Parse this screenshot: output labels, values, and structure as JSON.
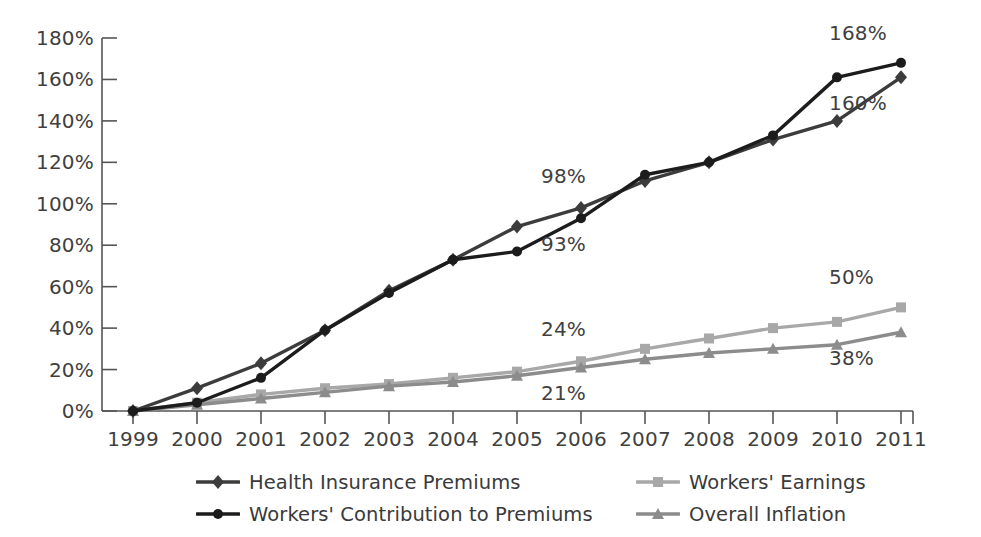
{
  "chart_data": {
    "type": "line",
    "title": "",
    "subtitle": "",
    "xlabel": "",
    "ylabel": "",
    "grid": false,
    "legend_position": "bottom",
    "x": [
      "1999",
      "2000",
      "2001",
      "2002",
      "2003",
      "2004",
      "2005",
      "2006",
      "2007",
      "2008",
      "2009",
      "2010",
      "2011"
    ],
    "xlim": [
      1999,
      2011
    ],
    "ylim": [
      0,
      180
    ],
    "y_ticks": [
      "0%",
      "20%",
      "40%",
      "60%",
      "80%",
      "100%",
      "120%",
      "140%",
      "160%",
      "180%"
    ],
    "y_tick_values": [
      0,
      20,
      40,
      60,
      80,
      100,
      120,
      140,
      160,
      180
    ],
    "series": [
      {
        "name": "Health Insurance Premiums",
        "marker": "diamond",
        "color": "#3c3c3c",
        "values": [
          0,
          11,
          23,
          39,
          58,
          73,
          89,
          98,
          111,
          120,
          131,
          140,
          161
        ]
      },
      {
        "name": "Workers' Contribution to Premiums",
        "marker": "circle",
        "color": "#1c1c1c",
        "values": [
          0,
          4,
          16,
          39,
          57,
          73,
          77,
          93,
          114,
          120,
          133,
          161,
          168
        ]
      },
      {
        "name": "Workers' Earnings",
        "marker": "square",
        "color": "#a8a8a8",
        "values": [
          0,
          4,
          8,
          11,
          13,
          16,
          19,
          24,
          30,
          35,
          40,
          43,
          50
        ]
      },
      {
        "name": "Overall Inflation",
        "marker": "triangle",
        "color": "#8c8c8c",
        "values": [
          0,
          3,
          6,
          9,
          12,
          14,
          17,
          21,
          25,
          28,
          30,
          32,
          38
        ]
      }
    ],
    "annotations": [
      {
        "text": "168%",
        "series": "Workers' Contribution to Premiums",
        "x": "2011",
        "value": 168,
        "position": "above"
      },
      {
        "text": "160%",
        "series": "Health Insurance Premiums",
        "x": "2011",
        "value": 161,
        "position": "below"
      },
      {
        "text": "98%",
        "series": "Health Insurance Premiums",
        "x": "2006",
        "value": 98,
        "position": "above"
      },
      {
        "text": "93%",
        "series": "Workers' Contribution to Premiums",
        "x": "2006",
        "value": 93,
        "position": "below"
      },
      {
        "text": "50%",
        "series": "Workers' Earnings",
        "x": "2011",
        "value": 50,
        "position": "above"
      },
      {
        "text": "38%",
        "series": "Overall Inflation",
        "x": "2011",
        "value": 38,
        "position": "below"
      },
      {
        "text": "24%",
        "series": "Workers' Earnings",
        "x": "2006",
        "value": 24,
        "position": "above"
      },
      {
        "text": "21%",
        "series": "Overall Inflation",
        "x": "2006",
        "value": 21,
        "position": "below"
      }
    ]
  },
  "legend": {
    "items": [
      {
        "label": "Health Insurance Premiums",
        "marker": "diamond",
        "color": "#3c3c3c"
      },
      {
        "label": "Workers' Earnings",
        "marker": "square",
        "color": "#a8a8a8"
      },
      {
        "label": "Workers' Contribution to Premiums",
        "marker": "circle",
        "color": "#1c1c1c"
      },
      {
        "label": "Overall Inflation",
        "marker": "triangle",
        "color": "#8c8c8c"
      }
    ]
  },
  "colors": {
    "axis": "#555555",
    "text": "#3a3a3a",
    "background": "#ffffff"
  }
}
